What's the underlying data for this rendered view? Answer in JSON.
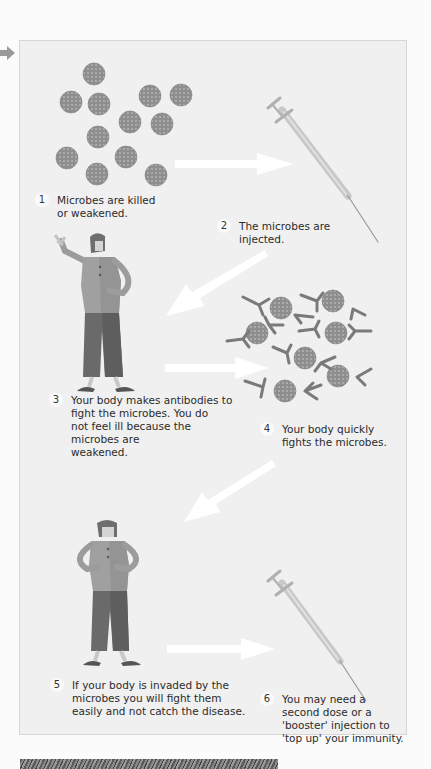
{
  "diagram": {
    "type": "process-flow",
    "topic": "How vaccination works",
    "steps": [
      {
        "number": "1",
        "text": "Microbes are killed\nor weakened."
      },
      {
        "number": "2",
        "text": "The microbes are\ninjected."
      },
      {
        "number": "3",
        "text": "Your body makes antibodies to\nfight the microbes. You do\nnot feel ill because the\nmicrobes are\nweakened."
      },
      {
        "number": "4",
        "text": "Your body quickly\nfights the microbes."
      },
      {
        "number": "5",
        "text": "If your body is invaded by the\nmicrobes you will fight them\neasily and not catch the disease."
      },
      {
        "number": "6",
        "text": "You may need a\nsecond dose or a\n'booster' injection to\n'top up' your immunity."
      }
    ],
    "icons": {
      "microbe": "microbe-icon",
      "syringe": "syringe-icon",
      "antibody": "antibody-icon",
      "person": "person-icon",
      "arrow": "arrow-icon"
    },
    "colors": {
      "panel_bg": "#f0f0f0",
      "panel_border": "#d6d6d6",
      "microbe": "#8c8c8c",
      "arrow": "#ffffff",
      "text": "#2b2b2b"
    }
  }
}
